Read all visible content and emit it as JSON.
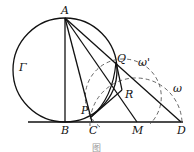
{
  "diagram": {
    "labels": {
      "A": "A",
      "B": "B",
      "C": "C",
      "M": "M",
      "D": "D",
      "P": "P",
      "Q": "Q",
      "R": "R",
      "gamma": "Γ",
      "omega": "ω",
      "omega_prime": "ω'"
    },
    "points": {
      "A": [
        65,
        18
      ],
      "B": [
        65,
        122
      ],
      "C": [
        92,
        122
      ],
      "M": [
        137,
        122
      ],
      "D": [
        181,
        122
      ],
      "P": [
        91,
        117
      ],
      "Q": [
        116,
        62
      ],
      "R": [
        122,
        90
      ]
    },
    "circles": {
      "Gamma": {
        "cx": 65,
        "cy": 70,
        "r": 52,
        "style": "solid"
      },
      "omega": {
        "cx": 136,
        "cy": 122,
        "r": 46,
        "style": "dashed"
      },
      "omega_prime": {
        "cx": 118,
        "cy": 98,
        "r": 38,
        "style": "dashed"
      }
    },
    "caption": "图"
  }
}
